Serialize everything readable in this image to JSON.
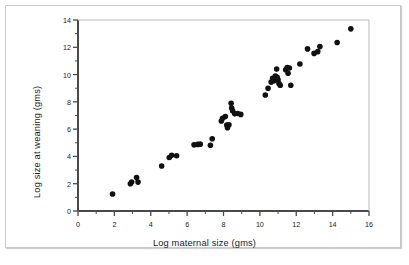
{
  "figure": {
    "background_color": "#ffffff",
    "frame_color": "#c8c8c8",
    "axis_color": "#4a4a4a",
    "point_color": "#111111"
  },
  "chart_data": {
    "type": "scatter",
    "title": "",
    "xlabel": "Log maternal size (gms)",
    "ylabel": "Log size at weaning (gms)",
    "xlim": [
      0,
      16
    ],
    "ylim": [
      0,
      14
    ],
    "xticks": [
      0,
      2,
      4,
      6,
      8,
      10,
      12,
      14,
      16
    ],
    "xtick_labels": [
      "0",
      "2",
      "4",
      "6",
      "8",
      "10",
      "12",
      "14",
      "16"
    ],
    "yticks": [
      0,
      2,
      4,
      6,
      8,
      10,
      12,
      14
    ],
    "ytick_labels": [
      "0",
      "2",
      "4",
      "6",
      "8",
      "10",
      "12",
      "14"
    ],
    "minor_ticks": true,
    "grid": false,
    "legend": null,
    "marker": "filled-circle",
    "marker_size_px": 5.6,
    "series": [
      {
        "name": "species",
        "color": "#111111",
        "points": [
          [
            1.9,
            1.25
          ],
          [
            2.88,
            2.0
          ],
          [
            2.95,
            2.12
          ],
          [
            3.22,
            2.45
          ],
          [
            3.3,
            2.12
          ],
          [
            4.6,
            3.3
          ],
          [
            5.02,
            3.92
          ],
          [
            5.15,
            4.08
          ],
          [
            5.42,
            4.05
          ],
          [
            6.38,
            4.85
          ],
          [
            6.58,
            4.88
          ],
          [
            6.72,
            4.9
          ],
          [
            7.28,
            4.82
          ],
          [
            7.38,
            5.3
          ],
          [
            7.88,
            6.6
          ],
          [
            7.95,
            6.8
          ],
          [
            8.1,
            6.92
          ],
          [
            8.18,
            6.3
          ],
          [
            8.22,
            6.1
          ],
          [
            8.3,
            6.32
          ],
          [
            8.42,
            7.9
          ],
          [
            8.45,
            7.55
          ],
          [
            8.5,
            7.35
          ],
          [
            8.62,
            7.12
          ],
          [
            8.78,
            7.15
          ],
          [
            8.95,
            7.08
          ],
          [
            10.3,
            8.5
          ],
          [
            10.45,
            9.0
          ],
          [
            10.62,
            9.45
          ],
          [
            10.7,
            9.72
          ],
          [
            10.78,
            9.55
          ],
          [
            10.85,
            9.9
          ],
          [
            10.92,
            10.4
          ],
          [
            10.95,
            9.8
          ],
          [
            11.0,
            9.62
          ],
          [
            11.05,
            9.35
          ],
          [
            11.12,
            9.22
          ],
          [
            11.42,
            10.35
          ],
          [
            11.5,
            10.52
          ],
          [
            11.55,
            10.1
          ],
          [
            11.62,
            10.48
          ],
          [
            11.7,
            9.22
          ],
          [
            12.2,
            10.78
          ],
          [
            12.62,
            11.88
          ],
          [
            12.98,
            11.55
          ],
          [
            13.18,
            11.68
          ],
          [
            13.3,
            12.05
          ],
          [
            14.25,
            12.35
          ],
          [
            15.0,
            13.35
          ]
        ]
      }
    ]
  }
}
